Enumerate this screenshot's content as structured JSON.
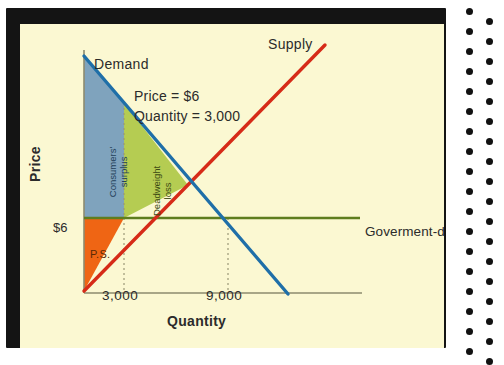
{
  "figure": {
    "background_color": "#fbf8d2",
    "frame_color": "#141414",
    "perforation_color": "#111111"
  },
  "chart_data": {
    "type": "line",
    "title": "",
    "xlabel": "Quantity",
    "ylabel": "Price",
    "xlim": [
      0,
      15000
    ],
    "ylim": [
      0,
      14
    ],
    "grid": false,
    "legend": "inline-annotations",
    "xticks": [
      "3,000",
      "9,000"
    ],
    "xtick_values": [
      3000,
      9000
    ],
    "yticks": [
      "$6"
    ],
    "ytick_values": [
      6
    ],
    "series": [
      {
        "name": "Demand",
        "color": "#1f6fa8",
        "x": [
          600,
          12000
        ],
        "y": [
          13.6,
          0.0
        ],
        "label": "Demand"
      },
      {
        "name": "Supply",
        "color": "#d62b18",
        "x": [
          600,
          14200
        ],
        "y": [
          0.1,
          14.2
        ],
        "label": "Supply"
      },
      {
        "name": "Goverment-dictated price",
        "color": "#5e7d1e",
        "x": [
          600,
          16800
        ],
        "y": [
          6,
          6
        ],
        "label": "Goverment-dictated price"
      }
    ],
    "regions": [
      {
        "name": "Consumers' surplus",
        "label": "Consumers' surplus",
        "color": "#7fa3bd",
        "description": "Area under demand curve above the government-dictated price, from 0 to 3,000"
      },
      {
        "name": "Deadweight loss",
        "label": "Deadweight loss",
        "color": "#b5cc52",
        "description": "Triangle between demand and supply curves from quantity 3,000 to equilibrium"
      },
      {
        "name": "Producers' surplus",
        "label": "P.S.",
        "color": "#ef6514",
        "description": "Area above supply curve below the government-dictated price, from 0 to 3,000"
      }
    ],
    "annotations": [
      {
        "name": "price-equilibrium",
        "text": "Price = $6"
      },
      {
        "name": "quantity-equilibrium",
        "text": "Quantity = 3,000"
      },
      {
        "name": "demand-label",
        "text": "Demand"
      },
      {
        "name": "supply-label",
        "text": "Supply"
      },
      {
        "name": "government-price-label",
        "text": "Goverment-dictated price"
      },
      {
        "name": "producer-surplus-label",
        "text": "P.S."
      }
    ],
    "dropline_quantities": [
      3000,
      9000
    ]
  },
  "labels": {
    "demand": "Demand",
    "supply": "Supply",
    "price_equilibrium": "Price = $6",
    "quantity_equilibrium": "Quantity = 3,000",
    "government_price": "Goverment-dictated price",
    "producer_surplus": "P.S.",
    "consumers_surplus_line1": "Consumers'",
    "consumers_surplus_line2": "surplus",
    "deadweight_line1": "Deadweight",
    "deadweight_line2": "loss",
    "axis_y": "Price",
    "axis_x": "Quantity",
    "tick_price": "$6",
    "tick_q_low": "3,000",
    "tick_q_high": "9,000"
  }
}
